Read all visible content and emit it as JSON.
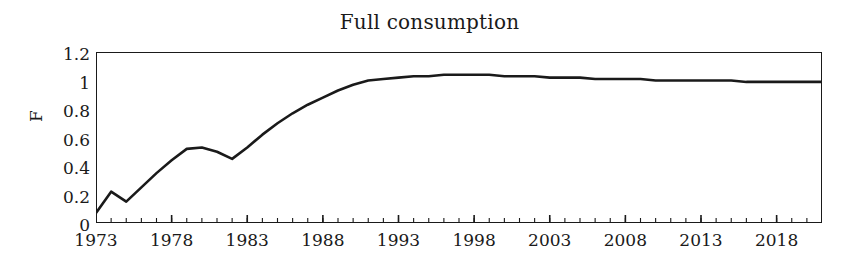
{
  "chart_data": {
    "type": "line",
    "title": "Full consumption",
    "xlabel": "",
    "ylabel": "F",
    "xlim": [
      1973,
      2021
    ],
    "ylim": [
      0,
      1.2
    ],
    "grid": false,
    "legend": null,
    "y_ticks": [
      "0",
      "0.2",
      "0.4",
      "0.6",
      "0.8",
      "1",
      "1.2"
    ],
    "y_tick_values": [
      0,
      0.2,
      0.4,
      0.6,
      0.8,
      1.0,
      1.2
    ],
    "x_ticks": [
      "1973",
      "1978",
      "1983",
      "1988",
      "1993",
      "1998",
      "2003",
      "2008",
      "2013",
      "2018"
    ],
    "x_tick_values": [
      1973,
      1978,
      1983,
      1988,
      1993,
      1998,
      2003,
      2008,
      2013,
      2018
    ],
    "x_minor_tick_step": 1,
    "series": [
      {
        "name": "F",
        "color": "#1a1a1a",
        "x": [
          1973,
          1974,
          1975,
          1976,
          1977,
          1978,
          1979,
          1980,
          1981,
          1982,
          1983,
          1984,
          1985,
          1986,
          1987,
          1988,
          1989,
          1990,
          1991,
          1992,
          1993,
          1994,
          1995,
          1996,
          1997,
          1998,
          1999,
          2000,
          2001,
          2002,
          2003,
          2004,
          2005,
          2006,
          2007,
          2008,
          2009,
          2010,
          2011,
          2012,
          2013,
          2014,
          2015,
          2016,
          2017,
          2018,
          2019,
          2020,
          2021
        ],
        "y": [
          0.07,
          0.22,
          0.15,
          0.25,
          0.35,
          0.44,
          0.52,
          0.53,
          0.5,
          0.45,
          0.53,
          0.62,
          0.7,
          0.77,
          0.83,
          0.88,
          0.93,
          0.97,
          1.0,
          1.01,
          1.02,
          1.03,
          1.03,
          1.04,
          1.04,
          1.04,
          1.04,
          1.03,
          1.03,
          1.03,
          1.02,
          1.02,
          1.02,
          1.01,
          1.01,
          1.01,
          1.01,
          1.0,
          1.0,
          1.0,
          1.0,
          1.0,
          1.0,
          0.99,
          0.99,
          0.99,
          0.99,
          0.99,
          0.99
        ]
      }
    ]
  }
}
